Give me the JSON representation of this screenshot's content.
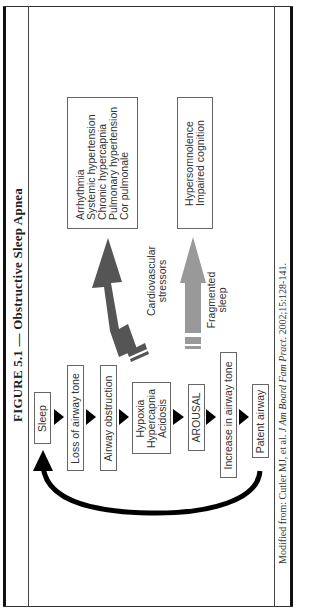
{
  "figure": {
    "title": "FIGURE 5.1 — Obstructive Sleep Apnea",
    "footnote": {
      "prefix": "Modified from: Cutler MJ, et al. ",
      "journal": "J Am Board Fam Pract",
      "suffix": ". 2002;15:128-141."
    }
  },
  "flow": {
    "steps": [
      {
        "label": "Sleep"
      },
      {
        "label": "Loss of airway tone"
      },
      {
        "label": "Airway obstruction"
      },
      {
        "label": "Hypoxia\nHypercapnia\nAcidosis",
        "lines": [
          "Hypoxia",
          "Hypercapnia",
          "Acidosis"
        ]
      },
      {
        "label": "AROUSAL"
      },
      {
        "label": "Increase in airway tone"
      },
      {
        "label": "Patent airway"
      }
    ],
    "cycle_arrow": "Patent airway returns to Sleep"
  },
  "consequences": {
    "cardiovascular": {
      "arrow_label_lines": [
        "Cardiovascular",
        "stressors"
      ],
      "arrow_color": "#555555",
      "outcomes": [
        "Arrhythmia",
        "Systemic hypertension",
        "Chronic hypercapnia",
        "Pulmonary hypertension",
        "Cor pulmonale"
      ]
    },
    "sleep": {
      "arrow_label_lines": [
        "Fragmented",
        "sleep"
      ],
      "arrow_color": "#999999",
      "outcomes": [
        "Hypersomnolence",
        "Impaired cognition"
      ]
    }
  },
  "colors": {
    "border": "#111111",
    "box_border": "#666666",
    "flow_arrow": "#000000",
    "dark_arrow": "#555555",
    "light_arrow": "#999999"
  }
}
